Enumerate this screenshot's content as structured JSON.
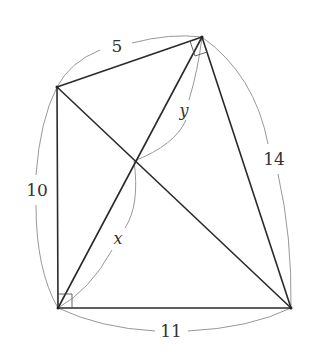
{
  "diagram": {
    "type": "quadrilateral-with-diagonals",
    "vertices": {
      "top_left": {
        "x": 57,
        "y": 87
      },
      "top_right": {
        "x": 202,
        "y": 37
      },
      "bottom_left": {
        "x": 58,
        "y": 308
      },
      "bottom_right": {
        "x": 291,
        "y": 308
      },
      "diagonal_intersection": {
        "x": 134,
        "y": 161
      }
    },
    "side_labels": {
      "top": "5",
      "left": "10",
      "right": "14",
      "bottom": "11"
    },
    "variable_labels": {
      "upper_segment": "y",
      "lower_segment": "x"
    },
    "right_angles": [
      "bottom_left",
      "top_right"
    ],
    "colors": {
      "edge": "#2a2a2a",
      "arc": "#8c8c8c",
      "text": "#333333"
    }
  }
}
